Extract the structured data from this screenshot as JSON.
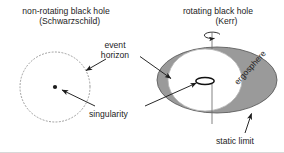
{
  "figure": {
    "width": 284,
    "height": 153,
    "background": "#ffffff",
    "border_color": "#d8d8d8"
  },
  "titles": {
    "left": "non-rotating black hole\n   (Schwarzschild)",
    "right": "rotating black hole\n       (Kerr)"
  },
  "labels": {
    "event_horizon": "event\nhorizon",
    "singularity": "singularity",
    "static_limit": "static limit",
    "ergosphere": "ergosphere"
  },
  "colors": {
    "line": "#1c1c1c",
    "text": "#1c1c1c",
    "ergosphere_fill": "#9a9a9a",
    "ergosphere_stroke": "#5a5a5a",
    "horizon_fill": "#ffffff",
    "dotted_circle": "#9c9c9c",
    "axis": "#6e6e6e"
  },
  "schwarzschild": {
    "horizon_circle": {
      "cx": 55,
      "cy": 87,
      "r": 35,
      "style": "dotted"
    },
    "singularity_point": {
      "cx": 55,
      "cy": 87,
      "r": 2.1,
      "style": "filled-dot"
    }
  },
  "kerr": {
    "static_limit_ellipse": {
      "cx": 217,
      "cy": 80,
      "rx": 60,
      "ry": 33
    },
    "event_horizon_ellipse": {
      "cx": 205,
      "cy": 80,
      "rx": 37,
      "ry": 31
    },
    "ring_singularity": {
      "cx": 205,
      "cy": 81,
      "rx": 9,
      "ry": 3.4
    },
    "rotation_axis": {
      "x": 212,
      "y_top": 33,
      "y_bottom": 124
    },
    "spin_arrow": {
      "cx": 212,
      "cy": 36,
      "rx": 8,
      "ry": 3.2,
      "direction": "counter-clockwise"
    }
  },
  "annotation_arrows": [
    {
      "name": "event-horizon-to-schwarzschild",
      "x1": 104,
      "y1": 60,
      "x2": 85,
      "y2": 71
    },
    {
      "name": "event-horizon-to-kerr",
      "x1": 139,
      "y1": 57,
      "x2": 172,
      "y2": 79
    },
    {
      "name": "singularity-to-schwarzschild",
      "x1": 94,
      "y1": 106,
      "x2": 61,
      "y2": 89
    },
    {
      "name": "singularity-to-kerr",
      "x1": 146,
      "y1": 106,
      "x2": 197,
      "y2": 83
    },
    {
      "name": "static-limit-to-ergosphere",
      "x1": 245,
      "y1": 134,
      "x2": 251,
      "y2": 113
    }
  ]
}
